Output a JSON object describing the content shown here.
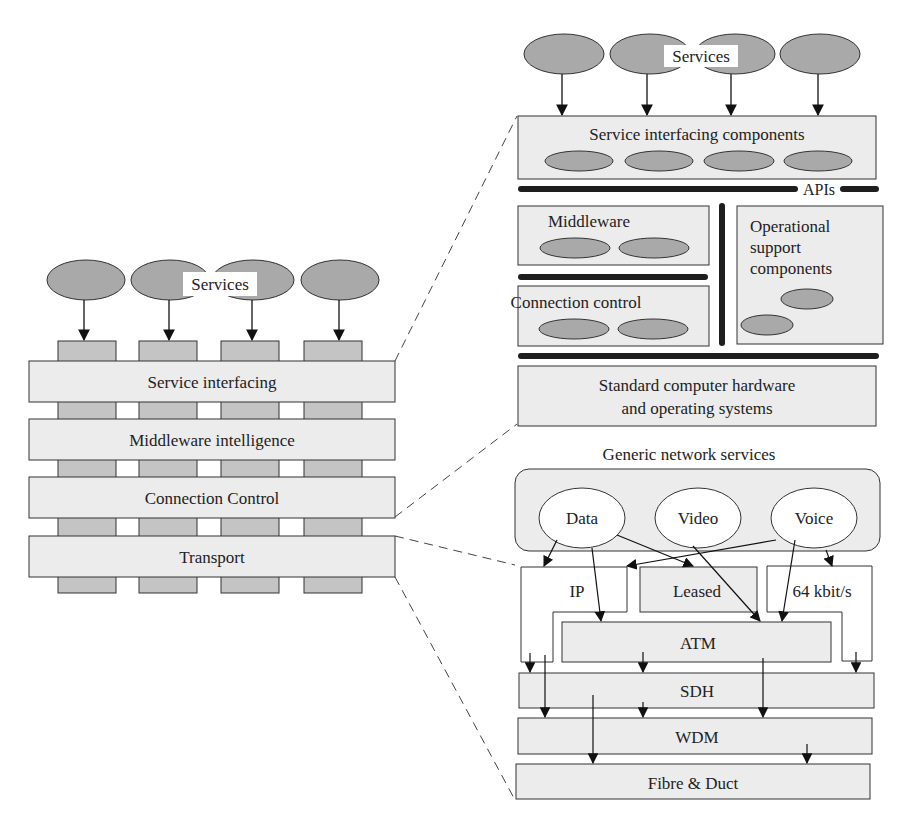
{
  "colors": {
    "band_fill": "#ececec",
    "pillar_fill": "#c4c4c4",
    "oval_fill": "#a9a9a9",
    "dark_bar": "#1e1e1e",
    "stroke": "#333333",
    "white": "#ffffff"
  },
  "left": {
    "services_label": "Services",
    "layers": [
      "Service interfacing",
      "Middleware intelligence",
      "Connection Control",
      "Transport"
    ]
  },
  "upper_right": {
    "services_label": "Services",
    "service_interfacing": "Service interfacing components",
    "apis_label": "APIs",
    "middleware": "Middleware",
    "connection_control": "Connection control",
    "operational_support": [
      "Operational",
      "support",
      "components"
    ],
    "hardware": [
      "Standard computer hardware",
      "and operating systems"
    ]
  },
  "lower_right": {
    "title": "Generic network services",
    "services": [
      "Data",
      "Video",
      "Voice"
    ],
    "ip": "IP",
    "leased": "Leased",
    "kbit": "64 kbit/s",
    "atm": "ATM",
    "sdh": "SDH",
    "wdm": "WDM",
    "fibre": "Fibre & Duct"
  }
}
